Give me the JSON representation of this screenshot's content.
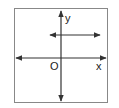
{
  "diagram": {
    "labels": {
      "y_axis": "y",
      "x_axis": "x",
      "origin": "O"
    },
    "colors": {
      "stroke": "#333333",
      "frame": "#777777",
      "background": "#ffffff"
    }
  }
}
